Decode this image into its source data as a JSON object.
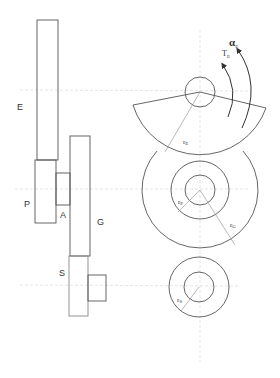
{
  "diagram": {
    "type": "gear train schematic (side view and front view)",
    "side_view": {
      "labels": {
        "E": "E",
        "P": "P",
        "A": "A",
        "G": "G",
        "S": "S"
      }
    },
    "front_view": {
      "labels": {
        "r_E": "r",
        "r_E_sub": "E",
        "r_P": "r",
        "r_P_sub": "P",
        "r_G": "r",
        "r_G_sub": "G",
        "r_S": "r",
        "r_S_sub": "S",
        "torque": "T",
        "torque_sub": "E",
        "alpha": "α",
        "alpha_sub": "E"
      }
    },
    "colors": {
      "stroke": "#555555",
      "construction_line": "#cfcfcf",
      "radius_line": "#999999"
    }
  }
}
